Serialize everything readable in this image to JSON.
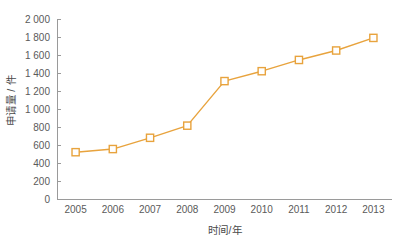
{
  "chart_data": {
    "type": "line",
    "title": "",
    "subtitle": "",
    "xlabel": "时间/年",
    "ylabel": "申请量 / 件",
    "categories": [
      "2005",
      "2006",
      "2007",
      "2008",
      "2009",
      "2010",
      "2011",
      "2012",
      "2013"
    ],
    "x": [
      2005,
      2006,
      2007,
      2008,
      2009,
      2010,
      2011,
      2012,
      2013
    ],
    "values": [
      520,
      555,
      680,
      815,
      1310,
      1420,
      1545,
      1650,
      1790
    ],
    "series": [
      {
        "name": "申请量",
        "values": [
          520,
          555,
          680,
          815,
          1310,
          1420,
          1545,
          1650,
          1790
        ]
      }
    ],
    "ylim": [
      0,
      2000
    ],
    "ytick_values": [
      0,
      200,
      400,
      600,
      800,
      1000,
      1200,
      1400,
      1600,
      1800,
      2000
    ],
    "ytick_labels": [
      "0",
      "200",
      "400",
      "600",
      "800",
      "1 000",
      "1 200",
      "1 400",
      "1 600",
      "1 800",
      "2 000"
    ],
    "xtick_labels": [
      "2005",
      "2006",
      "2007",
      "2008",
      "2009",
      "2010",
      "2011",
      "2012",
      "2013"
    ],
    "grid": false,
    "legend": null,
    "legend_position": "none",
    "annotations": [],
    "colors": {
      "line": "#E8A33D",
      "marker_stroke": "#E8A33D",
      "marker_fill": "#FFFFFF",
      "axis": "#9A9A9A",
      "text": "#4A4A4A",
      "background": "#FFFFFF"
    },
    "marker_shape": "square"
  }
}
